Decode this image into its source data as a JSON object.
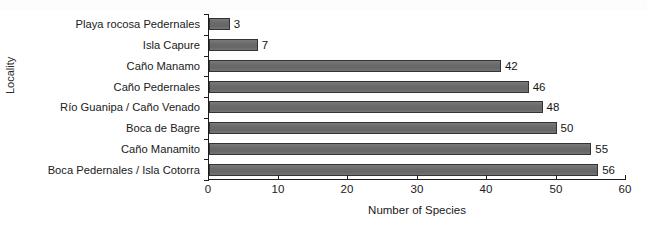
{
  "chart_data": {
    "type": "bar",
    "orientation": "horizontal",
    "title": "",
    "xlabel": "Number of Species",
    "ylabel": "Locality",
    "xlim": [
      0,
      60
    ],
    "xticks": [
      0,
      10,
      20,
      30,
      40,
      50,
      60
    ],
    "grid": false,
    "legend": null,
    "bar_color": "#6b6b6b",
    "bar_border_color": "#333333",
    "axis_color": "#1c1c1c",
    "categories": [
      "Playa rocosa Pedernales",
      "Isla Capure",
      "Caño Manamo",
      "Caño Pedernales",
      "Río Guanipa / Caño Venado",
      "Boca de Bagre",
      "Caño Manamito",
      "Boca Pedernales / Isla Cotorra"
    ],
    "values": [
      3,
      7,
      42,
      46,
      48,
      50,
      55,
      56
    ],
    "data_labels": [
      "3",
      "7",
      "42",
      "46",
      "48",
      "50",
      "55",
      "56"
    ],
    "points": [
      {
        "category": "Playa rocosa Pedernales",
        "value": 3,
        "label": "3"
      },
      {
        "category": "Isla Capure",
        "value": 7,
        "label": "7"
      },
      {
        "category": "Caño Manamo",
        "value": 42,
        "label": "42"
      },
      {
        "category": "Caño Pedernales",
        "value": 46,
        "label": "46"
      },
      {
        "category": "Río Guanipa / Caño Venado",
        "value": 48,
        "label": "48"
      },
      {
        "category": "Boca de Bagre",
        "value": 50,
        "label": "50"
      },
      {
        "category": "Caño Manamito",
        "value": 55,
        "label": "55"
      },
      {
        "category": "Boca Pedernales / Isla Cotorra",
        "value": 56,
        "label": "56"
      }
    ]
  }
}
